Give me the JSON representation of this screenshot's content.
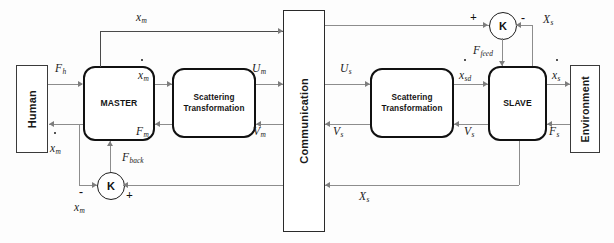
{
  "diagram": {
    "blocks": {
      "human": {
        "label": "Human"
      },
      "master": {
        "label": "MASTER"
      },
      "scattering_master": {
        "line1": "Scattering",
        "line2": "Transformation"
      },
      "communication": {
        "label": "Communication"
      },
      "scattering_slave": {
        "line1": "Scattering",
        "line2": "Transformation"
      },
      "slave": {
        "label": "SLAVE"
      },
      "environment": {
        "label": "Environment"
      },
      "sum_master": {
        "label": "K"
      },
      "sum_slave": {
        "label": "K"
      }
    },
    "signals": {
      "x_m_top": {
        "base": "x",
        "sub": "m",
        "dot": false
      },
      "f_h": {
        "base": "F",
        "sub": "h",
        "dot": false
      },
      "xdot_m_master_out": {
        "base": "x",
        "sub": "m",
        "dot": true
      },
      "u_m": {
        "base": "U",
        "sub": "m",
        "dot": false
      },
      "xdot_m_human": {
        "base": "x",
        "sub": "m",
        "dot": true
      },
      "f_m": {
        "base": "F",
        "sub": "m",
        "dot": false
      },
      "v_m": {
        "base": "V",
        "sub": "m",
        "dot": false
      },
      "f_back": {
        "base": "F",
        "sub": "back",
        "dot": false
      },
      "x_m_feedback": {
        "base": "x",
        "sub": "m",
        "dot": false
      },
      "u_s": {
        "base": "U",
        "sub": "s",
        "dot": false
      },
      "xdot_sd": {
        "base": "x",
        "sub": "sd",
        "dot": true
      },
      "f_feed": {
        "base": "F",
        "sub": "feed",
        "dot": false
      },
      "xdot_s": {
        "base": "x",
        "sub": "s",
        "dot": true
      },
      "x_s_top": {
        "base": "X",
        "sub": "s",
        "dot": false
      },
      "v_s_left": {
        "base": "V",
        "sub": "s",
        "dot": false
      },
      "v_s_right": {
        "base": "V",
        "sub": "s",
        "dot": false
      },
      "f_s": {
        "base": "F",
        "sub": "s",
        "dot": false
      },
      "x_s_bottom": {
        "base": "X",
        "sub": "s",
        "dot": false
      }
    },
    "signs": {
      "master_minus": "-",
      "master_plus": "+",
      "slave_plus": "+",
      "slave_minus": "-"
    },
    "colors": {
      "wire": "#8d8d8d",
      "block_border": "#111111",
      "thin_border": "#3a3a3a",
      "text": "#1a1a1a",
      "background": "#ffffff"
    }
  }
}
